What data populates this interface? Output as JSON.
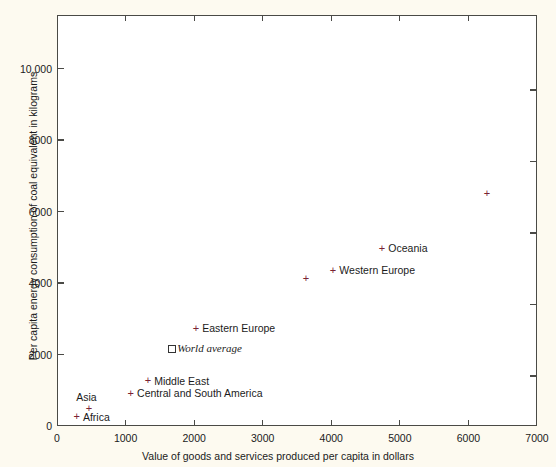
{
  "chart_data": {
    "type": "scatter",
    "title": "",
    "xlabel": "Value of goods and services produced per capita in dollars",
    "ylabel": "Per capita energy consumption of coal equivalent in kilograms",
    "xlim": [
      0,
      7000
    ],
    "ylim": [
      0,
      11500
    ],
    "grid": false,
    "legend": "none",
    "xticks": [
      0,
      1000,
      2000,
      3000,
      4000,
      5000,
      6000,
      7000
    ],
    "xtick_labels": [
      "0",
      "1000",
      "2000",
      "3000",
      "4000",
      "5000",
      "6000",
      "7000"
    ],
    "yticks": [
      0,
      2000,
      4000,
      6000,
      8000,
      10000
    ],
    "ytick_labels": [
      "0",
      "2000",
      "4000",
      "6000",
      "8000",
      "10,000"
    ],
    "band": {
      "name": "correlation band",
      "color": "#c8aeab",
      "description": "Shaded diagonal band of correlation between income and energy use"
    },
    "points": [
      {
        "name": "Africa",
        "x": 290,
        "y": 265,
        "label": "Africa",
        "marker": "plus",
        "label_side": "right"
      },
      {
        "name": "Asia",
        "x": 470,
        "y": 500,
        "label": "Asia",
        "marker": "plus",
        "label_side": "above"
      },
      {
        "name": "Central and South America",
        "x": 1080,
        "y": 910,
        "label": "Central and South America",
        "marker": "plus",
        "label_side": "right"
      },
      {
        "name": "Middle East",
        "x": 1330,
        "y": 1265,
        "label": "Middle East",
        "marker": "plus",
        "label_side": "right"
      },
      {
        "name": "World average",
        "x": 1665,
        "y": 2180,
        "label": "World average",
        "marker": "square",
        "label_side": "right"
      },
      {
        "name": "Eastern Europe",
        "x": 2030,
        "y": 2735,
        "label": "Eastern Europe",
        "marker": "plus",
        "label_side": "right"
      },
      {
        "name": "Japan",
        "x": 3635,
        "y": 4120,
        "label": "Japan",
        "marker": "plus",
        "label_side": "left"
      },
      {
        "name": "Western Europe",
        "x": 4030,
        "y": 4355,
        "label": "Western Europe",
        "marker": "plus",
        "label_side": "right"
      },
      {
        "name": "Oceania",
        "x": 4745,
        "y": 4970,
        "label": "Oceania",
        "marker": "plus",
        "label_side": "right"
      },
      {
        "name": "Australia",
        "x": 6275,
        "y": 6510,
        "label": "Australia",
        "marker": "plus",
        "label_side": "left"
      },
      {
        "name": "North America",
        "x": 7000,
        "y": 11200,
        "label": "North America",
        "marker": "none",
        "label_side": "left"
      }
    ],
    "colors": {
      "band": "#c8aeab",
      "marker": "#7a2233",
      "axis": "#4a4a46",
      "text": "#1b1b1b",
      "page_background": "#fdfaf0",
      "plot_background": "#ffffff"
    }
  }
}
